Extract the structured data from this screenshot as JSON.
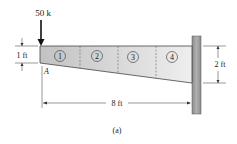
{
  "load": {
    "label": "50 k"
  },
  "point": {
    "label": "A"
  },
  "dimensions": {
    "left_depth": "1 ft",
    "right_depth": "2 ft",
    "length": "8 ft"
  },
  "segments": [
    "1",
    "2",
    "3",
    "4"
  ],
  "caption": "(a)",
  "colors": {
    "beam_fill_left": "#c4c4c4",
    "beam_fill_right": "#ececec",
    "wall": "#9a9a9a",
    "ink": "#222222"
  }
}
